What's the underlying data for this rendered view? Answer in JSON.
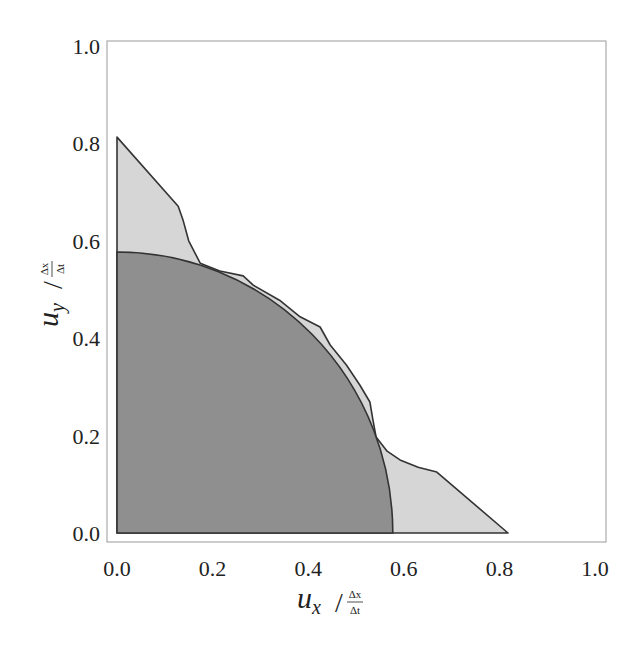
{
  "chart_data": {
    "type": "area",
    "title": "",
    "xlabel": "u_x / (Δx/Δt)",
    "ylabel": "u_y / (Δx/Δt)",
    "xlabel_parts": {
      "main": "u",
      "sub": "x",
      "num": "Δx",
      "den": "Δt"
    },
    "ylabel_parts": {
      "main": "u",
      "sub": "y",
      "num": "Δx",
      "den": "Δt"
    },
    "xlim": [
      0,
      1.0
    ],
    "ylim": [
      0,
      1.0
    ],
    "xticks": [
      "0.0",
      "0.2",
      "0.4",
      "0.6",
      "0.8",
      "1.0"
    ],
    "yticks": [
      "0.0",
      "0.2",
      "0.4",
      "0.6",
      "0.8",
      "1.0"
    ],
    "grid": false,
    "legend": null,
    "series": [
      {
        "name": "outer stability region (light)",
        "color": "#d6d6d6",
        "points": [
          [
            0,
            0
          ],
          [
            0,
            0.813
          ],
          [
            0.128,
            0.671
          ],
          [
            0.138,
            0.643
          ],
          [
            0.15,
            0.6
          ],
          [
            0.174,
            0.554
          ],
          [
            0.215,
            0.538
          ],
          [
            0.264,
            0.528
          ],
          [
            0.285,
            0.509
          ],
          [
            0.34,
            0.478
          ],
          [
            0.383,
            0.444
          ],
          [
            0.425,
            0.423
          ],
          [
            0.446,
            0.386
          ],
          [
            0.48,
            0.345
          ],
          [
            0.508,
            0.304
          ],
          [
            0.529,
            0.269
          ],
          [
            0.535,
            0.235
          ],
          [
            0.542,
            0.197
          ],
          [
            0.565,
            0.168
          ],
          [
            0.592,
            0.15
          ],
          [
            0.63,
            0.135
          ],
          [
            0.669,
            0.125
          ],
          [
            0.818,
            0
          ]
        ]
      },
      {
        "name": "quarter circle (dark)",
        "color": "#8f8f8f",
        "shape": "quarter-circle",
        "radius": 0.577
      }
    ]
  }
}
